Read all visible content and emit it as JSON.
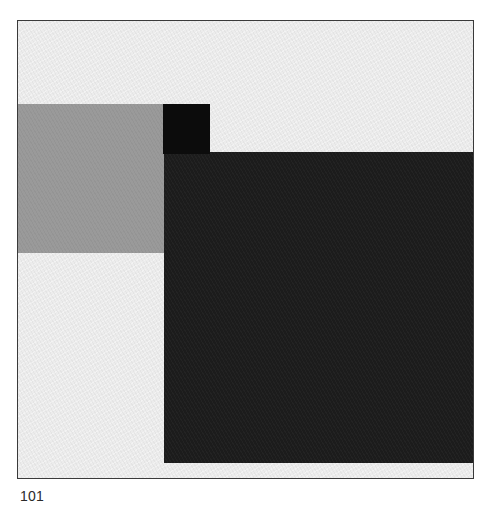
{
  "artwork": {
    "frame": {
      "left": 17,
      "top": 20,
      "width": 455,
      "height": 457,
      "border_color": "#3a3a3a"
    },
    "ground_color": "#ececec",
    "shapes": [
      {
        "name": "gray-rectangle",
        "color": "#9a9a9a",
        "left": 0,
        "top": 83,
        "width": 146,
        "height": 149
      },
      {
        "name": "black-small-square",
        "color": "#0c0c0c",
        "left": 145,
        "top": 83,
        "width": 47,
        "height": 50
      },
      {
        "name": "dark-large-rectangle",
        "color": "#1c1c1c",
        "left": 146,
        "top": 131,
        "width": 309,
        "height": 311
      }
    ]
  },
  "caption": {
    "page_number": "101"
  }
}
